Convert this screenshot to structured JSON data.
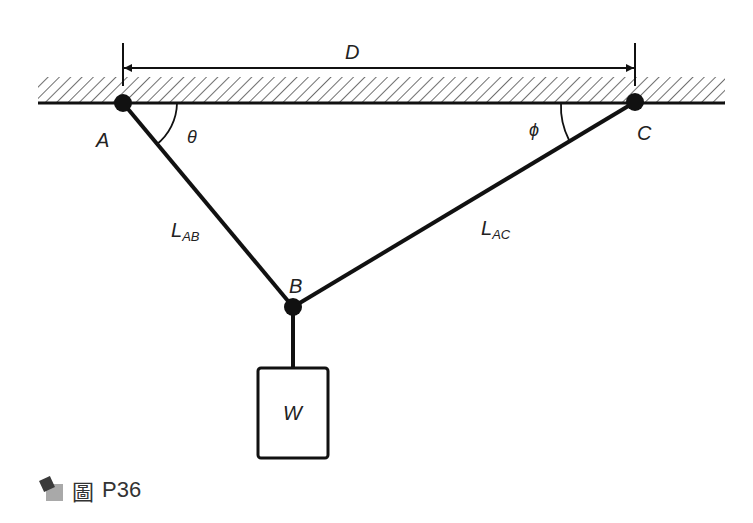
{
  "figure": {
    "caption_prefix": "圖",
    "caption_id": "P36",
    "labels": {
      "dimension": "D",
      "point_a": "A",
      "point_b": "B",
      "point_c": "C",
      "angle_theta": "θ",
      "angle_phi": "ϕ",
      "length_ab_main": "L",
      "length_ab_sub": "AB",
      "length_ac_main": "L",
      "length_ac_sub": "AC",
      "weight": "W"
    },
    "colors": {
      "line": "#111111",
      "text": "#222222",
      "icon_dark": "#3a3a3a",
      "icon_light": "#a9a9a9"
    }
  }
}
